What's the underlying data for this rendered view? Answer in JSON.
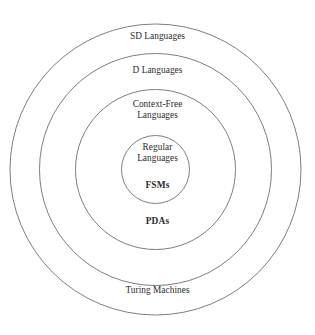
{
  "diagram": {
    "type": "nested-set-venn",
    "background_color": "#ffffff",
    "stroke_color": "#7e7e7e",
    "text_color": "#2b2b2b",
    "center": {
      "x": 155.5,
      "y": 169.5
    },
    "rings": [
      {
        "name": "sd-languages-ring",
        "radius": 145.5,
        "label": "SD Languages"
      },
      {
        "name": "d-languages-ring",
        "radius": 116.0,
        "label": "D Languages"
      },
      {
        "name": "context-free-ring",
        "radius": 80.0,
        "label": "Context-Free\nLanguages"
      },
      {
        "name": "regular-ring",
        "radius": 34.0,
        "label": "Regular\nLanguages"
      }
    ],
    "labels": {
      "sd_languages": "SD Languages",
      "d_languages": "D Languages",
      "context_free_languages": "Context-Free\nLanguages",
      "regular_languages": "Regular\nLanguages",
      "fsms": "FSMs",
      "pdas": "PDAs",
      "turing_machines": "Turing Machines"
    }
  },
  "chart_data": {
    "type": "diagram",
    "title": "",
    "subtype": "nested circles (Chomsky / computability hierarchy)",
    "categories": [
      "Regular Languages",
      "Context-Free Languages",
      "D Languages",
      "SD Languages"
    ],
    "values": [
      34,
      80,
      116,
      145.5
    ],
    "ylabel": "circle radius (px)",
    "xlabel": "",
    "annotations": [
      "FSMs",
      "PDAs",
      "Turing Machines"
    ],
    "legend": []
  }
}
